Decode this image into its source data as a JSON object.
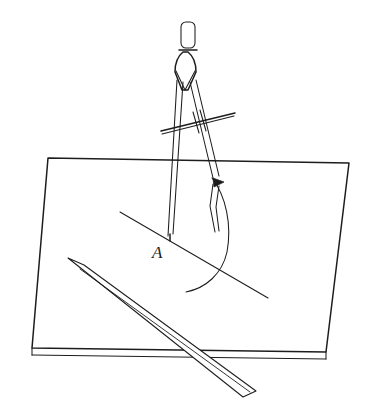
{
  "figure": {
    "caption": "",
    "background_color": "#ffffff",
    "ink_color": "#1d1d1d",
    "labels": [
      {
        "id": "point-a",
        "text": "A",
        "x": 152,
        "y": 258,
        "style": "italic-serif"
      }
    ],
    "objects": {
      "drawing_board": {
        "name": "drawing-board",
        "shape": "quadrilateral",
        "corners": [
          [
            48,
            158
          ],
          [
            349,
            163
          ],
          [
            326,
            352
          ],
          [
            32,
            348
          ]
        ],
        "has_edge_thickness": true,
        "thickness_px": 7
      },
      "ruler": {
        "name": "straight-edge-ruler",
        "shape": "long-parallelogram",
        "corners": [
          [
            68,
            258
          ],
          [
            84,
            265
          ],
          [
            256,
            391
          ],
          [
            243,
            397
          ]
        ],
        "angle_deg": 36
      },
      "compass": {
        "name": "pair-of-compasses",
        "handle": {
          "name": "knurled-handle",
          "x": 181,
          "y": 22,
          "width": 14,
          "height": 26
        },
        "hinge": {
          "name": "compass-hinge",
          "top_y": 52,
          "bottom_y": 92
        },
        "needle_leg": {
          "name": "needle-leg",
          "tip": [
            170,
            240
          ]
        },
        "pencil_leg": {
          "name": "pencil-leg",
          "tip": [
            214,
            232
          ]
        },
        "crossbar": {
          "name": "adjusting-crossbar",
          "from": [
            161,
            131
          ],
          "to": [
            235,
            113
          ],
          "tick_marks": 2
        },
        "arrow_marker": {
          "name": "direction-arrowhead",
          "x": 219,
          "y": 182
        }
      },
      "construction_line": {
        "name": "construction-line",
        "from": [
          120,
          212
        ],
        "to": [
          268,
          298
        ]
      },
      "arc": {
        "name": "compass-arc",
        "from": [
          212,
          178
        ],
        "to": [
          186,
          292
        ],
        "center": [
          170,
          240
        ]
      }
    }
  }
}
